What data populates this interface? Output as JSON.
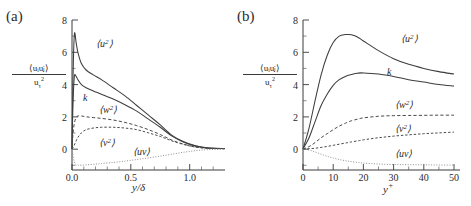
{
  "figure": {
    "panels": [
      {
        "tag": "(a)",
        "name": "outer-scaling",
        "ylabel_numerator": "⟨uᵢuⱼ⟩",
        "ylabel_denominator": "uτ²",
        "xlabel": "y/δ",
        "xticks": [
          "0.0",
          "0.5",
          "1.0"
        ],
        "xtick_values": [
          0.0,
          0.5,
          1.0
        ],
        "yticks": [
          "0",
          "2",
          "4",
          "6",
          "8"
        ],
        "ytick_values": [
          0,
          2,
          4,
          6,
          8
        ],
        "xlim": [
          0,
          1.3
        ],
        "ylim": [
          -1.3,
          8
        ],
        "curve_labels": {
          "uu": "⟨u",
          "uu_sup": "2",
          "uu_end": "⟩",
          "k": "k",
          "ww": "⟨w",
          "vv": "⟨v",
          "uv": "⟨uv⟩"
        }
      },
      {
        "tag": "(b)",
        "name": "inner-scaling",
        "ylabel_numerator": "⟨uᵢuⱼ⟩",
        "ylabel_denominator": "uτ²",
        "xlabel": "y+",
        "xticks": [
          "0",
          "10",
          "20",
          "30",
          "40",
          "50"
        ],
        "xtick_values": [
          0,
          10,
          20,
          30,
          40,
          50
        ],
        "yticks": [
          "0",
          "2",
          "4",
          "6",
          "8"
        ],
        "ytick_values": [
          0,
          2,
          4,
          6,
          8
        ],
        "xlim": [
          0,
          52
        ],
        "ylim": [
          -1.3,
          8
        ],
        "curve_labels": {
          "uu": "⟨u",
          "k": "k",
          "ww": "⟨w",
          "vv": "⟨v",
          "uv": "⟨uv⟩"
        }
      }
    ]
  },
  "chart_data": [
    {
      "type": "line",
      "panel": "(a)",
      "title": "Reynolds stresses in outer scaling",
      "xlabel": "y/δ",
      "ylabel": "⟨u_i u_j⟩ / u_τ^2",
      "xlim": [
        0,
        1.3
      ],
      "ylim": [
        -1.3,
        8
      ],
      "xticks": [
        0.0,
        0.5,
        1.0
      ],
      "yticks": [
        0,
        2,
        4,
        6,
        8
      ],
      "grid": false,
      "legend": "inline-annotations",
      "x": [
        0.0,
        0.008,
        0.02,
        0.035,
        0.05,
        0.08,
        0.12,
        0.18,
        0.25,
        0.35,
        0.45,
        0.55,
        0.65,
        0.75,
        0.85,
        0.95,
        1.05,
        1.15,
        1.3
      ],
      "series": [
        {
          "name": "⟨u²⟩",
          "style": "solid",
          "values": [
            0.0,
            4.2,
            7.1,
            6.6,
            6.0,
            5.3,
            4.9,
            4.6,
            4.3,
            3.8,
            3.3,
            2.7,
            2.1,
            1.5,
            0.85,
            0.45,
            0.2,
            0.08,
            0.03
          ]
        },
        {
          "name": "k",
          "style": "solid",
          "values": [
            0.0,
            2.7,
            4.5,
            4.5,
            4.3,
            4.0,
            3.8,
            3.6,
            3.4,
            3.1,
            2.75,
            2.35,
            1.85,
            1.35,
            0.8,
            0.42,
            0.18,
            0.07,
            0.03
          ]
        },
        {
          "name": "⟨w²⟩",
          "style": "dashed",
          "values": [
            0.0,
            0.9,
            1.6,
            1.95,
            2.05,
            2.05,
            2.0,
            1.95,
            1.9,
            1.8,
            1.65,
            1.45,
            1.2,
            0.9,
            0.55,
            0.3,
            0.13,
            0.05,
            0.02
          ]
        },
        {
          "name": "⟨v²⟩",
          "style": "dashed",
          "values": [
            0.0,
            0.08,
            0.25,
            0.5,
            0.72,
            1.0,
            1.2,
            1.3,
            1.35,
            1.35,
            1.3,
            1.2,
            1.0,
            0.78,
            0.5,
            0.28,
            0.12,
            0.05,
            0.02
          ]
        },
        {
          "name": "⟨uv⟩",
          "style": "dotted",
          "values": [
            0.0,
            -0.35,
            -0.8,
            -0.97,
            -1.0,
            -1.0,
            -0.98,
            -0.95,
            -0.9,
            -0.83,
            -0.75,
            -0.65,
            -0.55,
            -0.44,
            -0.32,
            -0.2,
            -0.1,
            -0.04,
            -0.01
          ]
        }
      ]
    },
    {
      "type": "line",
      "panel": "(b)",
      "title": "Reynolds stresses in inner (wall) scaling",
      "xlabel": "y+",
      "ylabel": "⟨u_i u_j⟩ / u_τ^2",
      "xlim": [
        0,
        52
      ],
      "ylim": [
        -1.3,
        8
      ],
      "xticks": [
        0,
        10,
        20,
        30,
        40,
        50
      ],
      "yticks": [
        0,
        2,
        4,
        6,
        8
      ],
      "grid": false,
      "legend": "inline-annotations",
      "x": [
        0,
        2,
        4,
        6,
        8,
        10,
        12,
        14,
        15,
        16,
        18,
        20,
        25,
        30,
        35,
        40,
        45,
        50
      ],
      "series": [
        {
          "name": "⟨u²⟩",
          "style": "solid",
          "values": [
            0.0,
            1.3,
            3.0,
            4.6,
            5.8,
            6.6,
            7.0,
            7.1,
            7.1,
            7.08,
            6.95,
            6.7,
            6.1,
            5.6,
            5.25,
            5.0,
            4.8,
            4.65
          ]
        },
        {
          "name": "k",
          "style": "solid",
          "values": [
            0.0,
            0.7,
            1.7,
            2.7,
            3.4,
            3.95,
            4.3,
            4.5,
            4.57,
            4.62,
            4.7,
            4.72,
            4.65,
            4.5,
            4.3,
            4.15,
            4.0,
            3.9
          ]
        },
        {
          "name": "⟨w²⟩",
          "style": "dashed",
          "values": [
            0.0,
            0.15,
            0.4,
            0.7,
            0.95,
            1.2,
            1.42,
            1.6,
            1.68,
            1.75,
            1.85,
            1.93,
            2.03,
            2.07,
            2.08,
            2.09,
            2.1,
            2.1
          ]
        },
        {
          "name": "⟨v²⟩",
          "style": "dashed",
          "values": [
            0.0,
            0.02,
            0.05,
            0.1,
            0.16,
            0.23,
            0.3,
            0.37,
            0.4,
            0.44,
            0.5,
            0.57,
            0.7,
            0.8,
            0.88,
            0.95,
            1.0,
            1.05
          ]
        },
        {
          "name": "⟨uv⟩",
          "style": "dotted",
          "values": [
            0.0,
            -0.06,
            -0.18,
            -0.32,
            -0.45,
            -0.56,
            -0.65,
            -0.72,
            -0.75,
            -0.78,
            -0.83,
            -0.87,
            -0.93,
            -0.96,
            -0.97,
            -0.98,
            -0.99,
            -1.0
          ]
        }
      ]
    }
  ]
}
